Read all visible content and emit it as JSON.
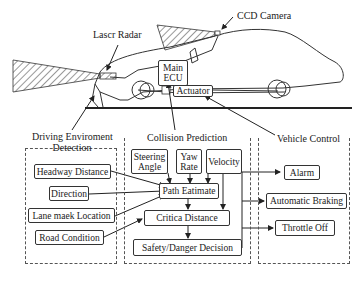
{
  "car_illustration": {
    "labels": {
      "laser_radar": "Lascr Radar",
      "ccd_camera": "CCD Camera",
      "main_ecu": "Main ECU",
      "actuator": "Actuator"
    }
  },
  "groups": {
    "driving_environment": {
      "title": "Driving Enviroment Detection",
      "title_line1": "Driving Enviroment",
      "title_line2": "Detection",
      "items": [
        "Headway Distance",
        "Direction",
        "Lane maek Location",
        "Road Condition"
      ]
    },
    "collision_prediction": {
      "title": "Collision Prediction",
      "inputs": [
        {
          "line1": "Steering",
          "line2": "Angle"
        },
        {
          "line1": "Yaw",
          "line2": "Rate"
        },
        {
          "line1": "Velocity",
          "line2": ""
        }
      ],
      "path_estimate": "Path Eatimate",
      "critical_distance": "Critica Distance",
      "decision": "Safety/Danger Decision"
    },
    "vehicle_control": {
      "title": "Vehicle Control",
      "items": [
        "Alarm",
        "Automatic Braking",
        "Throttle Off"
      ]
    }
  },
  "caption": "Fig. — system block diagram"
}
